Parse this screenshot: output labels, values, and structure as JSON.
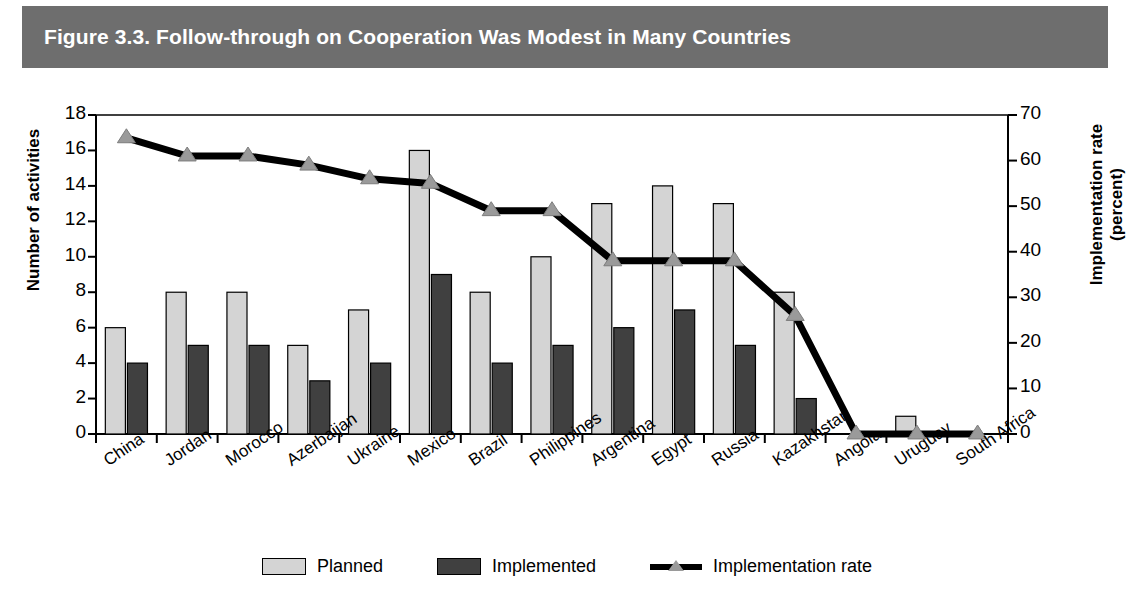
{
  "figure": {
    "title": "Figure 3.3.  Follow-through on Cooperation Was Modest in Many Countries",
    "banner_color": "#6e6e6e"
  },
  "legend": {
    "position": "bottom-center",
    "items": [
      {
        "label": "Planned",
        "marker": "light-gray-bar",
        "color": "#d4d4d4"
      },
      {
        "label": "Implemented",
        "marker": "dark-gray-bar",
        "color": "#404040"
      },
      {
        "label": "Implementation rate",
        "marker": "black-line-triangle",
        "color": "#000000"
      }
    ]
  },
  "chart_data": {
    "type": "bar",
    "title": "Figure 3.3.  Follow-through on Cooperation Was Modest in Many Countries",
    "xlabel": "",
    "ylabel": "Number of activities",
    "y2label": "Implementation rate\n(percent)",
    "ylim": [
      0,
      18
    ],
    "yticks": [
      0,
      2,
      4,
      6,
      8,
      10,
      12,
      14,
      16,
      18
    ],
    "y2lim": [
      0,
      70
    ],
    "y2ticks": [
      0,
      10,
      20,
      30,
      40,
      50,
      60,
      70
    ],
    "grid": false,
    "legend": "bottom",
    "categories": [
      "China",
      "Jordan",
      "Morocco",
      "Azerbaijan",
      "Ukraine",
      "Mexico",
      "Brazil",
      "Philippines",
      "Argentina",
      "Egypt",
      "Russia",
      "Kazakhstan",
      "Angola",
      "Uruguay",
      "South Africa"
    ],
    "series": [
      {
        "name": "Planned",
        "type": "bar",
        "axis": "left",
        "color": "#d4d4d4",
        "values": [
          6,
          8,
          8,
          5,
          7,
          16,
          8,
          10,
          13,
          14,
          13,
          8,
          0,
          1,
          0
        ]
      },
      {
        "name": "Implemented",
        "type": "bar",
        "axis": "left",
        "color": "#404040",
        "values": [
          4,
          5,
          5,
          3,
          4,
          9,
          4,
          5,
          6,
          7,
          5,
          2,
          0,
          0,
          0
        ]
      },
      {
        "name": "Implementation rate",
        "type": "line",
        "axis": "right",
        "color": "#000000",
        "marker": "triangle",
        "values": [
          65,
          61,
          61,
          59,
          56,
          55,
          49,
          49,
          38,
          38,
          38,
          26,
          0,
          0,
          0
        ]
      }
    ]
  },
  "axes": {
    "left_title": "Number of activities",
    "right_title_line1": "Implementation rate",
    "right_title_line2": "(percent)"
  }
}
